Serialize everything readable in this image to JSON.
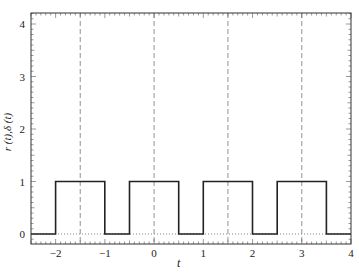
{
  "chart_data": {
    "type": "line",
    "title": "",
    "xlabel": "t",
    "ylabel": "r (t), δ (t)",
    "xlim": [
      -2.5,
      4
    ],
    "ylim": [
      -0.2,
      4.2
    ],
    "xticks": [
      -2,
      -1,
      0,
      1,
      2,
      3,
      4
    ],
    "xtick_labels": [
      "−2",
      "−1",
      "0",
      "1",
      "2",
      "3",
      "4"
    ],
    "yticks": [
      0,
      1,
      2,
      3,
      4
    ],
    "ytick_labels": [
      "0",
      "1",
      "2",
      "3",
      "4"
    ],
    "grid": false,
    "series": [
      {
        "name": "r(t) rectangular pulse train",
        "style": "solid",
        "x": [
          -2.5,
          -2,
          -2,
          -1,
          -1,
          -0.5,
          -0.5,
          0.5,
          0.5,
          1,
          1,
          2,
          2,
          2.5,
          2.5,
          3.5,
          3.5,
          4
        ],
        "y": [
          0,
          0,
          1,
          1,
          0,
          0,
          1,
          1,
          0,
          0,
          1,
          1,
          0,
          0,
          1,
          1,
          0,
          0
        ]
      },
      {
        "name": "δ(t) impulse train (sample positions)",
        "style": "dashed-vertical",
        "x": [
          -1.5,
          0,
          1.5,
          3
        ]
      },
      {
        "name": "zero baseline",
        "style": "dotted",
        "y": 0
      }
    ],
    "pulse_period": 1.5,
    "pulse_width": 1,
    "pulse_height": 1
  },
  "labels": {
    "xlabel": "t",
    "ylabel": "r (t),δ (t)"
  }
}
